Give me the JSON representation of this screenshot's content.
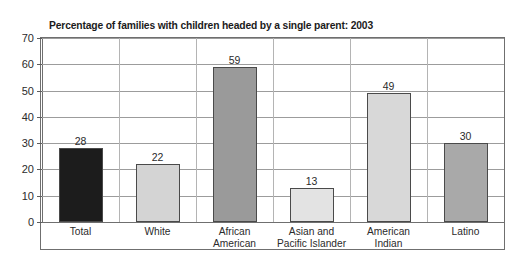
{
  "chart_data": {
    "type": "bar",
    "title": "Percentage of families with children headed by a single parent: 2003",
    "xlabel": "",
    "ylabel": "",
    "ylim": [
      0,
      70
    ],
    "ytick_step": 10,
    "grid": true,
    "legend": "none",
    "categories": [
      "Total",
      "White",
      "African\nAmerican",
      "Asian and\nPacific Islander",
      "American\nIndian",
      "Latino"
    ],
    "values": [
      28,
      22,
      59,
      13,
      49,
      30
    ],
    "value_labels": [
      "28",
      "22",
      "59",
      "13",
      "49",
      "30"
    ],
    "ytick_labels": [
      "0",
      "10",
      "20",
      "30",
      "40",
      "50",
      "60",
      "70"
    ],
    "bar_colors": [
      "#1c1c1c",
      "#d4d4d4",
      "#9a9a9a",
      "#e3e3e3",
      "#d8d8d8",
      "#a9a9a9"
    ],
    "bar_border_color": "#4a4a4a",
    "axis_color": "#6f6f6f",
    "grid_color": "#9c9c9c",
    "text_color": "#2b2b2b"
  }
}
